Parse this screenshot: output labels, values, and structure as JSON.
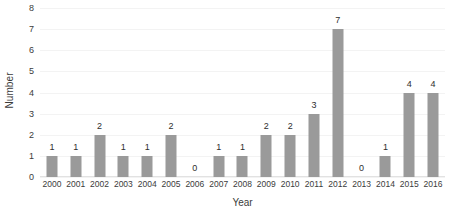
{
  "chart_data": {
    "type": "bar",
    "title": "",
    "xlabel": "Year",
    "ylabel": "Number",
    "categories": [
      "2000",
      "2001",
      "2002",
      "2003",
      "2004",
      "2005",
      "2006",
      "2007",
      "2008",
      "2009",
      "2010",
      "2011",
      "2012",
      "2013",
      "2014",
      "2015",
      "2016"
    ],
    "values": [
      1,
      1,
      2,
      1,
      1,
      2,
      0,
      1,
      1,
      2,
      2,
      3,
      7,
      0,
      1,
      4,
      4
    ],
    "data_labels": [
      "1",
      "1",
      "2",
      "1",
      "1",
      "2",
      "0",
      "1",
      "1",
      "2",
      "2",
      "3",
      "7",
      "0",
      "1",
      "4",
      "4"
    ],
    "ylim": [
      0,
      8
    ],
    "ytick_values": [
      0,
      1,
      2,
      3,
      4,
      5,
      6,
      7,
      8
    ],
    "ytick_labels": [
      "0",
      "1",
      "2",
      "3",
      "4",
      "5",
      "6",
      "7",
      "8"
    ],
    "grid": true,
    "grid_axis": "y",
    "legend": false,
    "legend_position": "none",
    "bar_color": "#9a9a9a",
    "gridline_color": "#f3f3f3",
    "axis_color": "#e2e2e2",
    "text_color": "#3b3b3b",
    "background_color": "#ffffff"
  }
}
